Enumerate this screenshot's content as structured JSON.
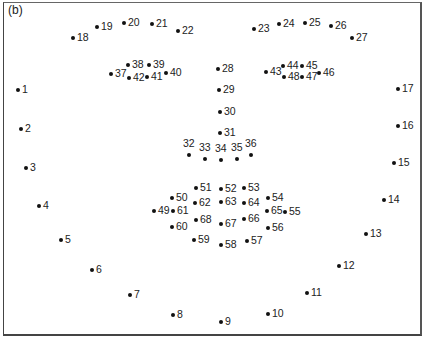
{
  "figure": {
    "panel_label": "(b)",
    "landmarks": [
      {
        "id": "1",
        "x": 18,
        "y": 90,
        "pos": "r"
      },
      {
        "id": "2",
        "x": 21,
        "y": 129,
        "pos": "r"
      },
      {
        "id": "3",
        "x": 26,
        "y": 168,
        "pos": "r"
      },
      {
        "id": "4",
        "x": 39,
        "y": 206,
        "pos": "r"
      },
      {
        "id": "5",
        "x": 61,
        "y": 240,
        "pos": "r"
      },
      {
        "id": "6",
        "x": 92,
        "y": 270,
        "pos": "r"
      },
      {
        "id": "7",
        "x": 130,
        "y": 295,
        "pos": "r"
      },
      {
        "id": "8",
        "x": 173,
        "y": 315,
        "pos": "r"
      },
      {
        "id": "9",
        "x": 221,
        "y": 322,
        "pos": "r"
      },
      {
        "id": "10",
        "x": 268,
        "y": 314,
        "pos": "r"
      },
      {
        "id": "11",
        "x": 307,
        "y": 293,
        "pos": "r"
      },
      {
        "id": "12",
        "x": 339,
        "y": 266,
        "pos": "r"
      },
      {
        "id": "13",
        "x": 366,
        "y": 234,
        "pos": "r"
      },
      {
        "id": "14",
        "x": 384,
        "y": 200,
        "pos": "r"
      },
      {
        "id": "15",
        "x": 394,
        "y": 163,
        "pos": "r"
      },
      {
        "id": "16",
        "x": 398,
        "y": 126,
        "pos": "r"
      },
      {
        "id": "17",
        "x": 398,
        "y": 89,
        "pos": "r"
      },
      {
        "id": "18",
        "x": 73,
        "y": 38,
        "pos": "r"
      },
      {
        "id": "19",
        "x": 97,
        "y": 27,
        "pos": "r"
      },
      {
        "id": "20",
        "x": 124,
        "y": 23,
        "pos": "r"
      },
      {
        "id": "21",
        "x": 152,
        "y": 24,
        "pos": "r"
      },
      {
        "id": "22",
        "x": 178,
        "y": 31,
        "pos": "r"
      },
      {
        "id": "23",
        "x": 254,
        "y": 29,
        "pos": "r"
      },
      {
        "id": "24",
        "x": 279,
        "y": 24,
        "pos": "r"
      },
      {
        "id": "25",
        "x": 305,
        "y": 23,
        "pos": "r"
      },
      {
        "id": "26",
        "x": 331,
        "y": 26,
        "pos": "r"
      },
      {
        "id": "27",
        "x": 352,
        "y": 38,
        "pos": "r"
      },
      {
        "id": "28",
        "x": 218,
        "y": 69,
        "pos": "r"
      },
      {
        "id": "29",
        "x": 219,
        "y": 90,
        "pos": "r"
      },
      {
        "id": "30",
        "x": 220,
        "y": 112,
        "pos": "r"
      },
      {
        "id": "31",
        "x": 220,
        "y": 133,
        "pos": "r"
      },
      {
        "id": "32",
        "x": 189,
        "y": 155,
        "pos": "t"
      },
      {
        "id": "33",
        "x": 205,
        "y": 159,
        "pos": "t"
      },
      {
        "id": "34",
        "x": 221,
        "y": 160,
        "pos": "t"
      },
      {
        "id": "35",
        "x": 237,
        "y": 159,
        "pos": "t"
      },
      {
        "id": "36",
        "x": 251,
        "y": 155,
        "pos": "t"
      },
      {
        "id": "37",
        "x": 111,
        "y": 74,
        "pos": "r"
      },
      {
        "id": "38",
        "x": 128,
        "y": 65,
        "pos": "r"
      },
      {
        "id": "39",
        "x": 149,
        "y": 65,
        "pos": "r"
      },
      {
        "id": "40",
        "x": 166,
        "y": 73,
        "pos": "r"
      },
      {
        "id": "41",
        "x": 147,
        "y": 77,
        "pos": "r"
      },
      {
        "id": "42",
        "x": 129,
        "y": 78,
        "pos": "r"
      },
      {
        "id": "43",
        "x": 266,
        "y": 72,
        "pos": "r"
      },
      {
        "id": "44",
        "x": 283,
        "y": 66,
        "pos": "r"
      },
      {
        "id": "45",
        "x": 302,
        "y": 66,
        "pos": "r"
      },
      {
        "id": "46",
        "x": 319,
        "y": 73,
        "pos": "r"
      },
      {
        "id": "47",
        "x": 302,
        "y": 77,
        "pos": "r"
      },
      {
        "id": "48",
        "x": 284,
        "y": 77,
        "pos": "r"
      },
      {
        "id": "49",
        "x": 154,
        "y": 211,
        "pos": "r"
      },
      {
        "id": "50",
        "x": 172,
        "y": 198,
        "pos": "r"
      },
      {
        "id": "51",
        "x": 196,
        "y": 188,
        "pos": "r"
      },
      {
        "id": "52",
        "x": 221,
        "y": 189,
        "pos": "r"
      },
      {
        "id": "53",
        "x": 244,
        "y": 188,
        "pos": "r"
      },
      {
        "id": "54",
        "x": 268,
        "y": 198,
        "pos": "r"
      },
      {
        "id": "55",
        "x": 285,
        "y": 212,
        "pos": "r"
      },
      {
        "id": "56",
        "x": 268,
        "y": 228,
        "pos": "r"
      },
      {
        "id": "57",
        "x": 247,
        "y": 241,
        "pos": "r"
      },
      {
        "id": "58",
        "x": 221,
        "y": 245,
        "pos": "r"
      },
      {
        "id": "59",
        "x": 194,
        "y": 240,
        "pos": "r"
      },
      {
        "id": "60",
        "x": 172,
        "y": 227,
        "pos": "r"
      },
      {
        "id": "61",
        "x": 173,
        "y": 211,
        "pos": "r"
      },
      {
        "id": "62",
        "x": 195,
        "y": 203,
        "pos": "r"
      },
      {
        "id": "63",
        "x": 221,
        "y": 202,
        "pos": "r"
      },
      {
        "id": "64",
        "x": 244,
        "y": 203,
        "pos": "r"
      },
      {
        "id": "65",
        "x": 267,
        "y": 211,
        "pos": "r"
      },
      {
        "id": "66",
        "x": 244,
        "y": 219,
        "pos": "r"
      },
      {
        "id": "67",
        "x": 221,
        "y": 224,
        "pos": "r"
      },
      {
        "id": "68",
        "x": 196,
        "y": 220,
        "pos": "r"
      }
    ]
  }
}
